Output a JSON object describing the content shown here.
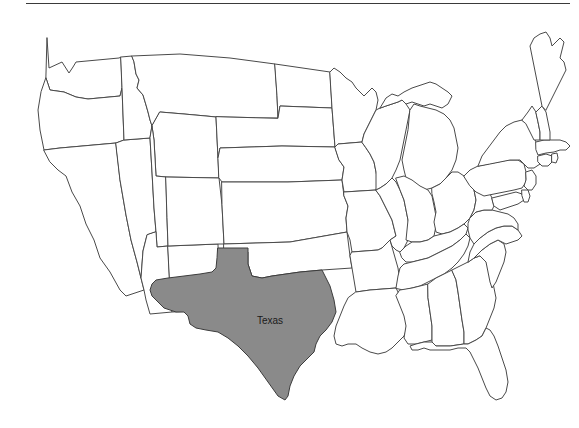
{
  "figure": {
    "kind": "choropleth-map",
    "region": "united-states-contiguous",
    "background_color": "#ffffff",
    "border_color": "#4a4a4a",
    "highlight_fill": "#8a8a8a",
    "default_fill": "#ffffff",
    "label_color": "#1a1a1a"
  },
  "rule": {
    "visible": true,
    "color": "#3a3a3a"
  },
  "labels": {
    "texas": "Texas"
  },
  "highlighted_states": [
    {
      "name": "Texas",
      "code": "TX",
      "fill": "#8a8a8a",
      "label": "Texas"
    }
  ],
  "states": [
    {
      "code": "WA",
      "name": "Washington",
      "fill": "#ffffff"
    },
    {
      "code": "OR",
      "name": "Oregon",
      "fill": "#ffffff"
    },
    {
      "code": "CA",
      "name": "California",
      "fill": "#ffffff"
    },
    {
      "code": "NV",
      "name": "Nevada",
      "fill": "#ffffff"
    },
    {
      "code": "ID",
      "name": "Idaho",
      "fill": "#ffffff"
    },
    {
      "code": "MT",
      "name": "Montana",
      "fill": "#ffffff"
    },
    {
      "code": "WY",
      "name": "Wyoming",
      "fill": "#ffffff"
    },
    {
      "code": "UT",
      "name": "Utah",
      "fill": "#ffffff"
    },
    {
      "code": "AZ",
      "name": "Arizona",
      "fill": "#ffffff"
    },
    {
      "code": "NM",
      "name": "New Mexico",
      "fill": "#ffffff"
    },
    {
      "code": "CO",
      "name": "Colorado",
      "fill": "#ffffff"
    },
    {
      "code": "ND",
      "name": "North Dakota",
      "fill": "#ffffff"
    },
    {
      "code": "SD",
      "name": "South Dakota",
      "fill": "#ffffff"
    },
    {
      "code": "NE",
      "name": "Nebraska",
      "fill": "#ffffff"
    },
    {
      "code": "KS",
      "name": "Kansas",
      "fill": "#ffffff"
    },
    {
      "code": "OK",
      "name": "Oklahoma",
      "fill": "#ffffff"
    },
    {
      "code": "TX",
      "name": "Texas",
      "fill": "#8a8a8a"
    },
    {
      "code": "MN",
      "name": "Minnesota",
      "fill": "#ffffff"
    },
    {
      "code": "IA",
      "name": "Iowa",
      "fill": "#ffffff"
    },
    {
      "code": "MO",
      "name": "Missouri",
      "fill": "#ffffff"
    },
    {
      "code": "AR",
      "name": "Arkansas",
      "fill": "#ffffff"
    },
    {
      "code": "LA",
      "name": "Louisiana",
      "fill": "#ffffff"
    },
    {
      "code": "WI",
      "name": "Wisconsin",
      "fill": "#ffffff"
    },
    {
      "code": "MI",
      "name": "Michigan",
      "fill": "#ffffff"
    },
    {
      "code": "IL",
      "name": "Illinois",
      "fill": "#ffffff"
    },
    {
      "code": "IN",
      "name": "Indiana",
      "fill": "#ffffff"
    },
    {
      "code": "OH",
      "name": "Ohio",
      "fill": "#ffffff"
    },
    {
      "code": "KY",
      "name": "Kentucky",
      "fill": "#ffffff"
    },
    {
      "code": "TN",
      "name": "Tennessee",
      "fill": "#ffffff"
    },
    {
      "code": "MS",
      "name": "Mississippi",
      "fill": "#ffffff"
    },
    {
      "code": "AL",
      "name": "Alabama",
      "fill": "#ffffff"
    },
    {
      "code": "GA",
      "name": "Georgia",
      "fill": "#ffffff"
    },
    {
      "code": "FL",
      "name": "Florida",
      "fill": "#ffffff"
    },
    {
      "code": "SC",
      "name": "South Carolina",
      "fill": "#ffffff"
    },
    {
      "code": "NC",
      "name": "North Carolina",
      "fill": "#ffffff"
    },
    {
      "code": "VA",
      "name": "Virginia",
      "fill": "#ffffff"
    },
    {
      "code": "WV",
      "name": "West Virginia",
      "fill": "#ffffff"
    },
    {
      "code": "MD",
      "name": "Maryland",
      "fill": "#ffffff"
    },
    {
      "code": "DE",
      "name": "Delaware",
      "fill": "#ffffff"
    },
    {
      "code": "PA",
      "name": "Pennsylvania",
      "fill": "#ffffff"
    },
    {
      "code": "NJ",
      "name": "New Jersey",
      "fill": "#ffffff"
    },
    {
      "code": "NY",
      "name": "New York",
      "fill": "#ffffff"
    },
    {
      "code": "CT",
      "name": "Connecticut",
      "fill": "#ffffff"
    },
    {
      "code": "RI",
      "name": "Rhode Island",
      "fill": "#ffffff"
    },
    {
      "code": "MA",
      "name": "Massachusetts",
      "fill": "#ffffff"
    },
    {
      "code": "VT",
      "name": "Vermont",
      "fill": "#ffffff"
    },
    {
      "code": "NH",
      "name": "New Hampshire",
      "fill": "#ffffff"
    },
    {
      "code": "ME",
      "name": "Maine",
      "fill": "#ffffff"
    }
  ]
}
